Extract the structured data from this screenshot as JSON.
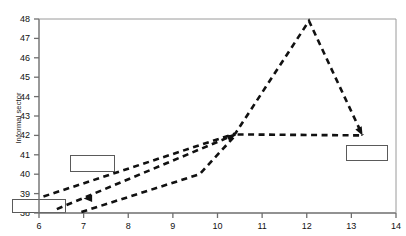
{
  "chart_data": {
    "type": "line",
    "title": "",
    "xlabel": "",
    "ylabel": "Informal sector",
    "xlim": [
      6,
      14
    ],
    "ylim": [
      38,
      48
    ],
    "grid": false,
    "legend": null,
    "xticks": [
      "6",
      "7",
      "8",
      "9",
      "10",
      "11",
      "12",
      "13",
      "14"
    ],
    "yticks": [
      "38",
      "39",
      "40",
      "41",
      "42",
      "43",
      "44",
      "45",
      "46",
      "47",
      "48"
    ],
    "line_style": "dashed",
    "line_color": "#111111",
    "series": [
      {
        "name": "upper-path",
        "points": [
          [
            6.1,
            38.85
          ],
          [
            10.4,
            42.1
          ],
          [
            12.05,
            47.9
          ],
          [
            13.25,
            42.0
          ]
        ]
      },
      {
        "name": "middle-path",
        "points": [
          [
            6.4,
            38.2
          ],
          [
            10.4,
            42.05
          ]
        ]
      },
      {
        "name": "lower-path",
        "points": [
          [
            6.95,
            38.05
          ],
          [
            9.6,
            40.0
          ],
          [
            10.4,
            42.0
          ]
        ]
      },
      {
        "name": "plateau-path",
        "points": [
          [
            10.45,
            42.05
          ],
          [
            13.25,
            42.0
          ]
        ]
      }
    ],
    "annotations": [
      {
        "name": "label-box-lower-left",
        "x": 6.0,
        "y": 38.35,
        "width_units": 1.2,
        "height_units": 0.75,
        "text": ""
      },
      {
        "name": "label-box-middle-left",
        "x": 7.2,
        "y": 40.55,
        "width_units": 1.0,
        "height_units": 0.85,
        "text": ""
      },
      {
        "name": "label-box-right",
        "x": 13.35,
        "y": 41.1,
        "width_units": 0.95,
        "height_units": 0.8,
        "text": ""
      }
    ],
    "arrowheads": [
      {
        "name": "arrow-into-lower-left-box",
        "x": 7.0,
        "y": 38.75,
        "direction": "left"
      },
      {
        "name": "arrow-into-convergence",
        "x": 10.4,
        "y": 42.05,
        "direction": "right"
      },
      {
        "name": "arrow-into-right-box",
        "x": 13.25,
        "y": 42.0,
        "direction": "down-right"
      }
    ]
  },
  "axis": {
    "y_axis_name": "y-axis",
    "x_axis_name": "x-axis"
  }
}
